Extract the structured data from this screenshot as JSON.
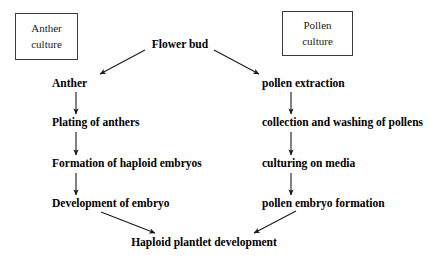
{
  "diagram": {
    "type": "flowchart",
    "background_color": "#ffffff",
    "line_color": "#1a1a1a",
    "text_color": "#000000",
    "box_border_color": "#3a3a3a"
  },
  "boxes": [
    {
      "id": "anther-culture",
      "line1": "Anther",
      "line2": "culture"
    },
    {
      "id": "pollen-culture",
      "line1": "Pollen",
      "line2": "culture"
    }
  ],
  "nodes": {
    "flower_bud": "Flower bud",
    "anther": "Anther",
    "plating_of_anthers": "Plating of anthers",
    "formation_of_haploid_embryos": "Formation of haploid embryos",
    "development_of_embryo": "Development of embryo",
    "pollen_extraction": "pollen extraction",
    "collection_and_washing_of_pollens": "collection and washing of pollens",
    "culturing_on_media": "culturing on media",
    "pollen_embryo_formation": "pollen embryo formation",
    "haploid_plantlet_development": "Haploid plantlet development"
  },
  "edges": [
    {
      "id": "flower-bud-to-anther",
      "from": "flower_bud",
      "to": "anther",
      "style": "diagonal-left"
    },
    {
      "id": "flower-bud-to-pollen-extraction",
      "from": "flower_bud",
      "to": "pollen_extraction",
      "style": "diagonal-right"
    },
    {
      "id": "anther-to-plating",
      "from": "anther",
      "to": "plating_of_anthers",
      "style": "vertical"
    },
    {
      "id": "plating-to-formation",
      "from": "plating_of_anthers",
      "to": "formation_of_haploid_embryos",
      "style": "vertical"
    },
    {
      "id": "formation-to-development",
      "from": "formation_of_haploid_embryos",
      "to": "development_of_embryo",
      "style": "vertical"
    },
    {
      "id": "development-to-haploid-plantlet",
      "from": "development_of_embryo",
      "to": "haploid_plantlet_development",
      "style": "diagonal-right"
    },
    {
      "id": "pollen-extraction-to-collection",
      "from": "pollen_extraction",
      "to": "collection_and_washing_of_pollens",
      "style": "vertical"
    },
    {
      "id": "collection-to-culturing",
      "from": "collection_and_washing_of_pollens",
      "to": "culturing_on_media",
      "style": "vertical"
    },
    {
      "id": "culturing-to-pollen-embryo",
      "from": "culturing_on_media",
      "to": "pollen_embryo_formation",
      "style": "vertical"
    },
    {
      "id": "pollen-embryo-to-haploid-plantlet",
      "from": "pollen_embryo_formation",
      "to": "haploid_plantlet_development",
      "style": "diagonal-left"
    }
  ]
}
